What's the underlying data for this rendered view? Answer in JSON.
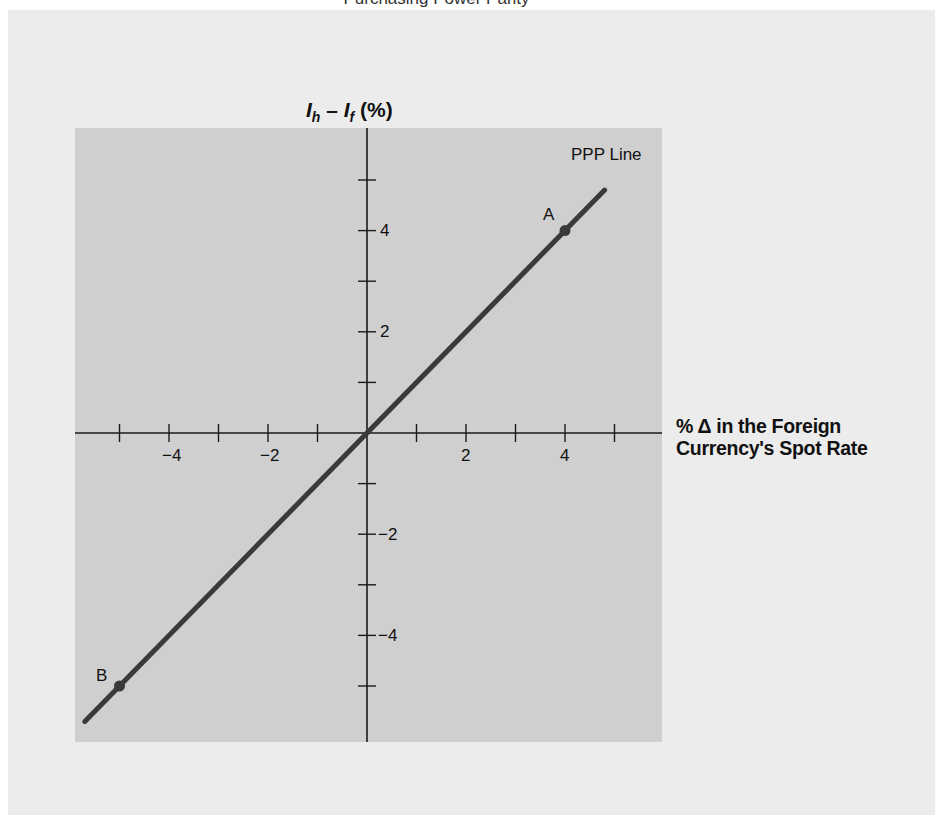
{
  "title": "Purchasing Power Parity",
  "colors": {
    "outer_background": "#ececec",
    "panel_background": "#cfcfcf",
    "axis": "#1a1a1a",
    "line": "#3a3a3a",
    "text": "#111111"
  },
  "axes": {
    "y_label_main": "I",
    "y_label_sub_h": "h",
    "y_label_minus": " – ",
    "y_label_sub_f": "f",
    "y_label_unit": " (%)",
    "x_label_line1": "% Δ in the Foreign",
    "x_label_line2": "Currency's Spot Rate",
    "x_tick_labels": [
      "−4",
      "−2",
      "2",
      "4"
    ],
    "y_tick_labels": [
      "4",
      "2",
      "−2",
      "−4"
    ]
  },
  "annotations": {
    "line_label": "PPP Line",
    "point_a": "A",
    "point_b": "B"
  },
  "chart_data": {
    "type": "line",
    "title": "Purchasing Power Parity",
    "xlabel": "% Δ in the Foreign Currency's Spot Rate",
    "ylabel": "Ih – If (%)",
    "xlim": [
      -5.8,
      5.8
    ],
    "ylim": [
      -5.8,
      5.8
    ],
    "x_ticks": [
      -5,
      -4,
      -3,
      -2,
      -1,
      1,
      2,
      3,
      4,
      5
    ],
    "y_ticks": [
      -5,
      -4,
      -3,
      -2,
      -1,
      1,
      2,
      3,
      4,
      5
    ],
    "labeled_x_ticks": [
      -4,
      -2,
      2,
      4
    ],
    "labeled_y_ticks": [
      -4,
      -2,
      2,
      4
    ],
    "grid": false,
    "series": [
      {
        "name": "PPP Line",
        "x": [
          -5.7,
          4.8
        ],
        "y": [
          -5.7,
          4.8
        ]
      }
    ],
    "points": [
      {
        "label": "A",
        "x": 4,
        "y": 4
      },
      {
        "label": "B",
        "x": -5,
        "y": -5
      }
    ]
  }
}
